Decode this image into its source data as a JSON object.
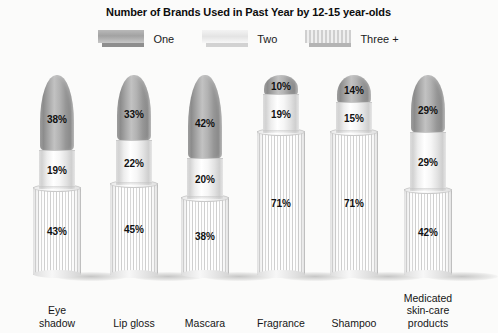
{
  "title": "Number of Brands Used in Past Year by 12-15 year-olds",
  "legend": {
    "items": [
      {
        "label": "One",
        "swatch": "one-swatch",
        "color": "#a8a8a8"
      },
      {
        "label": "Two",
        "swatch": "two-swatch",
        "color": "#ededed"
      },
      {
        "label": "Three +",
        "swatch": "three-plus-swatch",
        "color": "#cfcfcf"
      }
    ]
  },
  "chart_data": {
    "type": "bar",
    "title": "Number of Brands Used in Past Year by 12-15 year-olds",
    "xlabel": "",
    "ylabel": "",
    "unit": "%",
    "stacked": true,
    "grid": false,
    "legend_position": "top",
    "categories": [
      "Eye shadow",
      "Lip gloss",
      "Mascara",
      "Fragrance",
      "Shampoo",
      "Medicated skin-care products"
    ],
    "series": [
      {
        "name": "One",
        "values": [
          38,
          33,
          42,
          10,
          14,
          29
        ]
      },
      {
        "name": "Two",
        "values": [
          19,
          22,
          20,
          19,
          15,
          29
        ]
      },
      {
        "name": "Three +",
        "values": [
          43,
          45,
          38,
          71,
          71,
          42
        ]
      }
    ]
  },
  "categories": [
    {
      "key": "eye-shadow",
      "lines": [
        "Eye",
        "shadow"
      ],
      "one": "38%",
      "two": "19%",
      "three": "43%"
    },
    {
      "key": "lip-gloss",
      "lines": [
        "Lip gloss"
      ],
      "one": "33%",
      "two": "22%",
      "three": "45%"
    },
    {
      "key": "mascara",
      "lines": [
        "Mascara"
      ],
      "one": "42%",
      "two": "20%",
      "three": "38%"
    },
    {
      "key": "fragrance",
      "lines": [
        "Fragrance"
      ],
      "one": "10%",
      "two": "19%",
      "three": "71%"
    },
    {
      "key": "shampoo",
      "lines": [
        "Shampoo"
      ],
      "one": "14%",
      "two": "15%",
      "three": "71%"
    },
    {
      "key": "medicated",
      "lines": [
        "Medicated",
        "skin-care",
        "products"
      ],
      "one": "29%",
      "two": "29%",
      "three": "42%"
    }
  ]
}
